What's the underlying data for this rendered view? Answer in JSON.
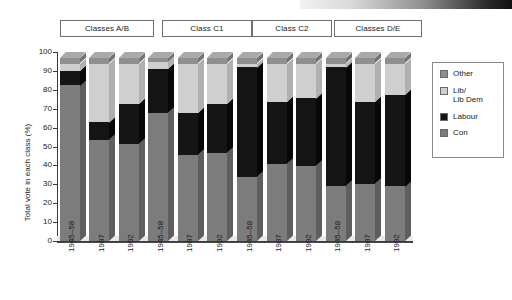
{
  "figure": {
    "y_axis_title": "Total vote in each class (%)",
    "scan_strip": "dark-gradient-artifact"
  },
  "legend": {
    "items": [
      {
        "label": "Other",
        "label2": "",
        "color": "#8f8f8f",
        "key": "other"
      },
      {
        "label": "Lib/",
        "label2": "Lib Dem",
        "color": "#cfcfcf",
        "key": "lib"
      },
      {
        "label": "Labour",
        "label2": "",
        "color": "#141414",
        "key": "labour"
      },
      {
        "label": "Con",
        "label2": "",
        "color": "#7c7c7c",
        "key": "con"
      }
    ]
  },
  "group_headers": [
    {
      "label": "Classes A/B"
    },
    {
      "label": "Class C1"
    },
    {
      "label": "Class C2"
    },
    {
      "label": "Classes D/E"
    }
  ],
  "y_ticks": [
    "100",
    "90",
    "80",
    "70",
    "60",
    "50",
    "40",
    "30",
    "20",
    "10",
    "0"
  ],
  "x_labels": [
    "1945–58",
    "1987",
    "1992",
    "1945–58",
    "1987",
    "1992",
    "1945–58",
    "1987",
    "1992",
    "1945–58",
    "1987",
    "1992"
  ],
  "chart_data": {
    "type": "bar",
    "subtype": "stacked-100-percent-3d",
    "title": "",
    "xlabel": "",
    "ylabel": "Total vote in each class (%)",
    "ylim": [
      0,
      100
    ],
    "ytick_step": 10,
    "grid": false,
    "legend_position": "right",
    "groups": [
      "Classes A/B",
      "Class C1",
      "Class C2",
      "Classes D/E"
    ],
    "categories": [
      "Classes A/B 1945–58",
      "Classes A/B 1987",
      "Classes A/B 1992",
      "Class C1 1945–58",
      "Class C1 1987",
      "Class C1 1992",
      "Class C2 1945–58",
      "Class C2 1987",
      "Class C2 1992",
      "Classes D/E 1945–58",
      "Classes D/E 1987",
      "Classes D/E 1992"
    ],
    "series": [
      {
        "name": "Con",
        "color": "#7c7c7c",
        "values": [
          85,
          55,
          53,
          70,
          47,
          48,
          35,
          42,
          41,
          30,
          31,
          30
        ]
      },
      {
        "name": "Labour",
        "color": "#141414",
        "values": [
          8,
          10,
          22,
          24,
          23,
          27,
          60,
          34,
          37,
          65,
          45,
          50
        ]
      },
      {
        "name": "Lib/Lib Dem",
        "color": "#cfcfcf",
        "values": [
          4,
          32,
          22,
          4,
          27,
          22,
          2,
          21,
          19,
          2,
          21,
          17
        ]
      },
      {
        "name": "Other",
        "color": "#8f8f8f",
        "values": [
          3,
          3,
          3,
          2,
          3,
          3,
          3,
          3,
          3,
          3,
          3,
          3
        ]
      }
    ],
    "cumulative_tops": {
      "con": [
        85,
        55,
        53,
        70,
        47,
        48,
        35,
        42,
        41,
        30,
        31,
        30
      ],
      "labour": [
        93,
        65,
        75,
        94,
        70,
        75,
        95,
        76,
        78,
        95,
        76,
        80
      ],
      "lib": [
        97,
        97,
        97,
        98,
        97,
        97,
        97,
        97,
        97,
        97,
        97,
        97
      ],
      "other": [
        100,
        100,
        100,
        100,
        100,
        100,
        100,
        100,
        100,
        100,
        100,
        100
      ]
    }
  }
}
